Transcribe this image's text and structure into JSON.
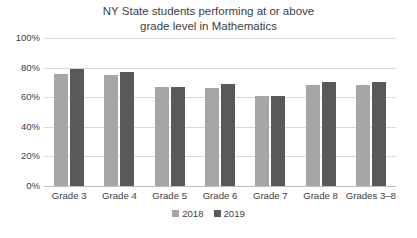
{
  "chart_data": {
    "type": "bar",
    "title": "NY State students performing at or above grade level in Mathematics",
    "title_line1": "NY State students performing at or above",
    "title_line2": "grade level in Mathematics",
    "xlabel": "",
    "ylabel": "",
    "ylim": [
      0,
      100
    ],
    "grid": true,
    "legend_position": "bottom",
    "categories": [
      "Grade 3",
      "Grade 4",
      "Grade 5",
      "Grade 6",
      "Grade 7",
      "Grade 8",
      "Grades 3–8"
    ],
    "ytick_labels": [
      "100%",
      "80%",
      "60%",
      "40%",
      "20%",
      "0%"
    ],
    "ytick_values": [
      100,
      80,
      60,
      40,
      20,
      0
    ],
    "series": [
      {
        "name": "2018",
        "color": "#a6a6a6",
        "values": [
          76,
          75,
          67,
          66,
          61,
          68,
          68
        ]
      },
      {
        "name": "2019",
        "color": "#595959",
        "values": [
          79,
          77,
          67,
          69,
          61,
          70,
          70
        ]
      }
    ]
  },
  "legend": {
    "items": [
      {
        "label": "2018",
        "color": "#a6a6a6"
      },
      {
        "label": "2019",
        "color": "#595959"
      }
    ]
  }
}
